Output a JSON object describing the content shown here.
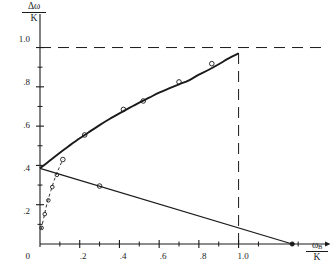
{
  "figure": {
    "axis_color": "#1a1a1a",
    "curve_color": "#1a1a1a",
    "background": "#ffffff"
  },
  "yaxis": {
    "label_numerator": "Δω",
    "label_denominator": "K",
    "ticks": [
      "1.0",
      ".8",
      ".6",
      ".4",
      ".2",
      "0"
    ],
    "tick_values": [
      1.0,
      0.8,
      0.6,
      0.4,
      0.2,
      0.0
    ],
    "range": [
      0,
      1.13
    ]
  },
  "xaxis": {
    "label_numerator": "ω",
    "label_subscript": "B",
    "label_denominator": "K",
    "ticks": [
      ".2",
      ".4",
      ".6",
      ".8",
      "1.0"
    ],
    "tick_values": [
      0.2,
      0.4,
      0.6,
      0.8,
      1.0
    ],
    "origin_tick": "0",
    "range": [
      0,
      1.42
    ]
  },
  "chart_data": {
    "type": "line",
    "title": "",
    "xlabel": "ω_B/K",
    "ylabel": "Δω/K",
    "xlim": [
      0,
      1.42
    ],
    "ylim": [
      0,
      1.13
    ],
    "grid": false,
    "legend": "none",
    "series": [
      {
        "name": "theoretical-curve",
        "style": "solid",
        "x": [
          0.0,
          0.05,
          0.1,
          0.15,
          0.2,
          0.25,
          0.3,
          0.35,
          0.4,
          0.45,
          0.5,
          0.55,
          0.6,
          0.65,
          0.7,
          0.75,
          0.8,
          0.85,
          0.9,
          0.95,
          1.0
        ],
        "y": [
          0.385,
          0.425,
          0.465,
          0.502,
          0.538,
          0.572,
          0.605,
          0.636,
          0.665,
          0.693,
          0.72,
          0.745,
          0.77,
          0.792,
          0.813,
          0.833,
          0.862,
          0.887,
          0.915,
          0.945,
          0.97
        ]
      },
      {
        "name": "measured-points-upper",
        "style": "open-circle",
        "x": [
          0.115,
          0.225,
          0.42,
          0.52,
          0.7,
          0.865
        ],
        "y": [
          0.43,
          0.555,
          0.685,
          0.728,
          0.825,
          0.918
        ]
      },
      {
        "name": "descending-line",
        "style": "solid",
        "x": [
          0.0,
          1.27
        ],
        "y": [
          0.385,
          0.0
        ]
      },
      {
        "name": "descending-endpoint",
        "style": "filled-circle",
        "x": [
          1.27
        ],
        "y": [
          0.0
        ]
      },
      {
        "name": "measured-points-lower",
        "style": "open-circle",
        "x": [
          0.3
        ],
        "y": [
          0.295
        ]
      },
      {
        "name": "dashed-rise",
        "style": "dashed",
        "x": [
          0.006,
          0.02,
          0.035,
          0.055,
          0.075,
          0.095,
          0.115
        ],
        "y": [
          0.075,
          0.138,
          0.205,
          0.272,
          0.335,
          0.385,
          0.43
        ]
      },
      {
        "name": "measured-points-dashed",
        "style": "open-circle",
        "x": [
          0.008,
          0.024,
          0.042,
          0.062,
          0.085
        ],
        "y": [
          0.082,
          0.152,
          0.222,
          0.29,
          0.352
        ]
      },
      {
        "name": "asymptote-horizontal",
        "style": "dashed",
        "x": [
          0.0,
          1.42
        ],
        "y": [
          1.0,
          1.0
        ]
      },
      {
        "name": "asymptote-vertical",
        "style": "dashed",
        "x": [
          1.0,
          1.0
        ],
        "y": [
          0.0,
          1.0
        ]
      }
    ]
  }
}
